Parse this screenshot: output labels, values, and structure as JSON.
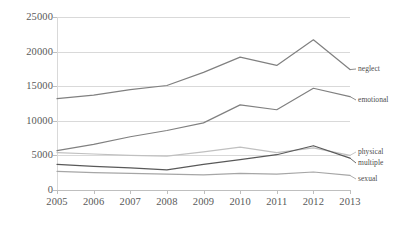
{
  "chart_data": {
    "type": "line",
    "title": "",
    "xlabel": "",
    "ylabel": "",
    "x": [
      "2005",
      "2006",
      "2007",
      "2008",
      "2009",
      "2010",
      "2011",
      "2012",
      "2013"
    ],
    "categories": [
      "2005",
      "2006",
      "2007",
      "2008",
      "2009",
      "2010",
      "2011",
      "2012",
      "2013"
    ],
    "ylim": [
      0,
      25000
    ],
    "xlim": [
      "2005",
      "2013"
    ],
    "yticks": [
      0,
      5000,
      10000,
      15000,
      20000,
      25000
    ],
    "ytick_labels": [
      "0",
      "5000",
      "10000",
      "15000",
      "20000",
      "25000"
    ],
    "grid": "horizontal",
    "legend_position": "right-inline-end-labels",
    "series": [
      {
        "name": "neglect",
        "color": "#808080",
        "values": [
          13200,
          13700,
          14500,
          15100,
          17000,
          19200,
          18000,
          21700,
          17400
        ]
      },
      {
        "name": "emotional",
        "color": "#808080",
        "values": [
          5700,
          6600,
          7700,
          8600,
          9700,
          12300,
          11600,
          14700,
          13500
        ]
      },
      {
        "name": "physical",
        "color": "#c0c0c0",
        "values": [
          5400,
          5200,
          5000,
          4900,
          5500,
          6200,
          5400,
          6100,
          5000
        ]
      },
      {
        "name": "multiple",
        "color": "#595959",
        "values": [
          3700,
          3400,
          3200,
          2900,
          3700,
          4400,
          5100,
          6400,
          4600
        ]
      },
      {
        "name": "sexual",
        "color": "#a6a6a6",
        "values": [
          2700,
          2500,
          2400,
          2300,
          2200,
          2400,
          2300,
          2600,
          2100
        ]
      }
    ],
    "end_labels": [
      {
        "text": "neglect",
        "y_px": 69
      },
      {
        "text": "emotional",
        "y_px": 100
      },
      {
        "text": "physical",
        "y_px": 152
      },
      {
        "text": "multiple",
        "y_px": 163
      },
      {
        "text": "sexual",
        "y_px": 179
      }
    ]
  },
  "colors": {
    "gridline": "#d9d9d9",
    "axis": "#bfbfbf",
    "text": "#595959",
    "background": "#ffffff"
  }
}
